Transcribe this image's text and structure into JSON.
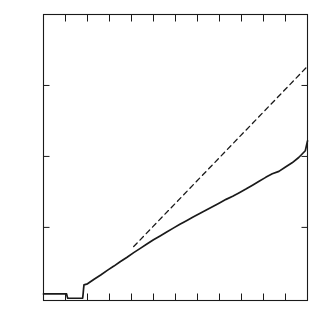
{
  "chart_data": {
    "type": "line",
    "title": "",
    "subtitle": "",
    "xlabel": "",
    "ylabel": "Optical density",
    "ylim": [
      -0.003,
      0.4
    ],
    "xlim": [
      0,
      12
    ],
    "grid": false,
    "legend": "none",
    "y_ticks": [
      {
        "value": 0.4,
        "label": "0.4"
      },
      {
        "value": 0.3,
        "label": "0.3"
      },
      {
        "value": 0.2,
        "label": "0.2"
      },
      {
        "value": 0.1,
        "label": "0.1"
      }
    ],
    "y_tick_labels": [
      "0.4",
      "0.3",
      "0.2",
      "0.1"
    ],
    "x_ticks": [
      0,
      1,
      2,
      3,
      4,
      5,
      6,
      7,
      8,
      9,
      10,
      11,
      12
    ],
    "x_tick_labels": [],
    "ticks_direction": "in",
    "ticks_on_all_sides": true,
    "frame": "box",
    "series": [
      {
        "name": "measured-curve",
        "style": "solid",
        "color": "#1a1a1a",
        "x": [
          0.0,
          0.4,
          0.8,
          1.05,
          1.09,
          1.1,
          1.45,
          1.78,
          1.8,
          1.82,
          1.84,
          2.0,
          2.3,
          2.6,
          2.9,
          3.2,
          3.5,
          3.8,
          4.1,
          4.4,
          4.7,
          5.0,
          5.3,
          5.6,
          5.9,
          6.2,
          6.5,
          6.8,
          7.1,
          7.4,
          7.7,
          8.0,
          8.3,
          8.6,
          8.9,
          9.2,
          9.5,
          9.8,
          10.1,
          10.4,
          10.7,
          11.0,
          11.3,
          11.6,
          11.9,
          12.0
        ],
        "y": [
          0.0063,
          0.0063,
          0.0062,
          0.0062,
          0.001,
          0.0003,
          0.0002,
          0.0002,
          0.006,
          0.013,
          0.019,
          0.0205,
          0.027,
          0.033,
          0.0395,
          0.0455,
          0.052,
          0.058,
          0.0645,
          0.0705,
          0.0765,
          0.0825,
          0.088,
          0.0935,
          0.099,
          0.1045,
          0.1095,
          0.1145,
          0.1195,
          0.1245,
          0.1295,
          0.1345,
          0.1395,
          0.144,
          0.149,
          0.154,
          0.1595,
          0.165,
          0.1705,
          0.1755,
          0.179,
          0.185,
          0.191,
          0.1985,
          0.208,
          0.222
        ]
      },
      {
        "name": "linear-extrapolation",
        "style": "dashed",
        "color": "#1a1a1a",
        "x": [
          4.1,
          12.0
        ],
        "y": [
          0.073,
          0.327
        ],
        "note": "dashed tangent line extending from the initial linear region"
      }
    ],
    "annotations": []
  },
  "axes": {
    "y_axis_title": "Optical density"
  }
}
